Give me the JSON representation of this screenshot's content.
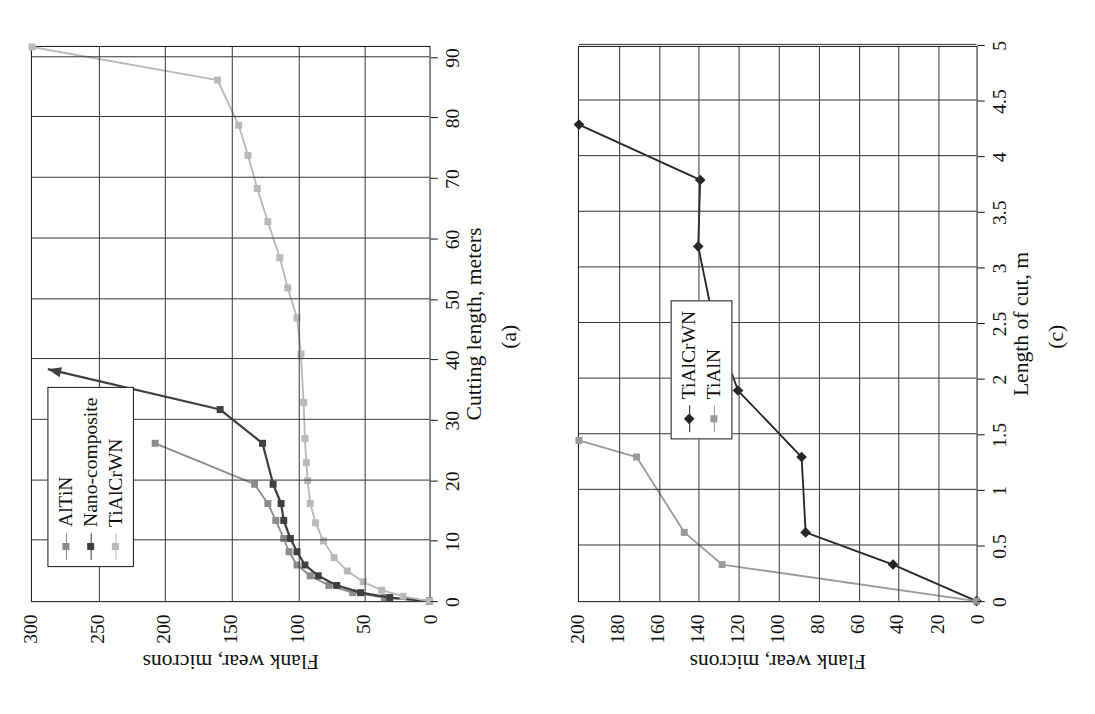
{
  "figure": {
    "panels": [
      "a",
      "c"
    ]
  },
  "chart_data": [
    {
      "id": "panel-a",
      "type": "line",
      "title": "",
      "caption": "(a)",
      "xlabel": "Cutting length, meters",
      "ylabel": "Flank wear, microns",
      "xlim": [
        0,
        92
      ],
      "ylim": [
        0,
        300
      ],
      "xticks": [
        0,
        10,
        20,
        30,
        40,
        50,
        60,
        70,
        80,
        90
      ],
      "yticks": [
        0,
        50,
        100,
        150,
        200,
        250,
        300
      ],
      "xticklabels": [
        "0",
        "10",
        "20",
        "30",
        "40",
        "50",
        "60",
        "70",
        "80",
        "90"
      ],
      "yticklabels": [
        "0",
        "50",
        "100",
        "150",
        "200",
        "250",
        "300"
      ],
      "grid": "vertical-and-horizontal",
      "legend_position": "upper-left-rotated",
      "rotation_deg": -90,
      "series": [
        {
          "name": "AlTiN",
          "color": "#8c8c8c",
          "marker": "square",
          "x": [
            0,
            0.6,
            1.4,
            2.6,
            4.2,
            6.0,
            8.2,
            10.4,
            13.4,
            16.2,
            19.4,
            26.2
          ],
          "values": [
            0,
            34,
            58,
            76,
            90,
            100,
            106,
            110,
            116,
            122,
            132,
            207
          ]
        },
        {
          "name": "Nano-composite",
          "color": "#3f3f3f",
          "marker": "square",
          "x": [
            0,
            0.6,
            1.4,
            2.6,
            4.2,
            6.0,
            8.2,
            10.4,
            13.4,
            16.2,
            19.4,
            26.2,
            31.8,
            38.5
          ],
          "values": [
            0,
            30,
            52,
            70,
            84,
            94,
            100,
            105,
            110,
            112,
            118,
            126,
            158,
            288
          ]
        },
        {
          "name": "TiAlCrWN",
          "color": "#b9b9b9",
          "marker": "square",
          "x": [
            0,
            0.8,
            1.8,
            3.2,
            5.0,
            7.2,
            10.0,
            13.0,
            16.2,
            20.0,
            23.0,
            27.0,
            33.0,
            41.0,
            47.0,
            52.0,
            57.0,
            63.0,
            68.5,
            74.0,
            79.0,
            86.5,
            92.0
          ],
          "values": [
            0,
            20,
            36,
            50,
            62,
            72,
            80,
            86,
            90,
            92,
            93,
            94,
            95,
            97,
            100,
            107,
            113,
            122,
            130,
            137,
            144,
            160,
            300
          ]
        }
      ]
    },
    {
      "id": "panel-c",
      "type": "line",
      "title": "",
      "caption": "(c)",
      "xlabel": "Length of cut, m",
      "ylabel": "Flank wear, microns",
      "xlim": [
        0,
        5
      ],
      "ylim": [
        0,
        200
      ],
      "xticks": [
        0,
        0.5,
        1,
        1.5,
        2,
        2.5,
        3,
        3.5,
        4,
        4.5,
        5
      ],
      "yticks": [
        0,
        20,
        40,
        60,
        80,
        100,
        120,
        140,
        160,
        180,
        200
      ],
      "xticklabels": [
        "0",
        "0.5",
        "1",
        "1.5",
        "2",
        "2.5",
        "3",
        "3.5",
        "4",
        "4.5",
        "5"
      ],
      "yticklabels": [
        "0",
        "20",
        "40",
        "60",
        "80",
        "100",
        "120",
        "140",
        "160",
        "180",
        "200"
      ],
      "grid": "vertical-and-horizontal",
      "legend_position": "upper-left-rotated",
      "rotation_deg": -90,
      "series": [
        {
          "name": "TiAlCrWN",
          "color": "#262626",
          "marker": "diamond",
          "x": [
            0,
            0.33,
            0.62,
            1.3,
            1.9,
            2.5,
            3.2,
            3.8,
            4.3
          ],
          "values": [
            0,
            42,
            86,
            88,
            120,
            132,
            140,
            139,
            200
          ]
        },
        {
          "name": "TiAlN",
          "color": "#9a9a9a",
          "marker": "square",
          "x": [
            0,
            0.33,
            0.62,
            1.3,
            1.45
          ],
          "values": [
            0,
            128,
            147,
            171,
            200
          ]
        }
      ]
    }
  ]
}
